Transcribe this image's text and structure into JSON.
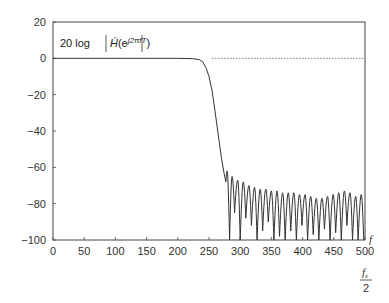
{
  "chart_data": {
    "type": "line",
    "title_parts": {
      "prefix": "20 log",
      "func": "Ĥ",
      "open": "(e",
      "exponent": "j2πfT",
      "close": ")"
    },
    "xlabel": "f",
    "xlabel_extra": {
      "numerator": "f",
      "numerator_sub": "s",
      "denominator": "2"
    },
    "ylabel": "",
    "xlim": [
      0,
      500
    ],
    "ylim": [
      -100,
      20
    ],
    "x_ticks": [
      0,
      50,
      100,
      150,
      200,
      250,
      300,
      350,
      400,
      450,
      500
    ],
    "x_tick_labels": [
      "0",
      "50",
      "100",
      "150",
      "200",
      "250",
      "300",
      "350",
      "400",
      "450",
      "500"
    ],
    "y_ticks": [
      20,
      0,
      -20,
      -40,
      -60,
      -80,
      -100
    ],
    "y_tick_labels": [
      "20",
      "0",
      "−20",
      "−40",
      "−60",
      "−80",
      "−100"
    ],
    "grid": false,
    "reference_line": {
      "y": 0,
      "style": "dotted",
      "x_start": 255,
      "x_end": 500
    },
    "series": [
      {
        "name": "magnitude response (dB)",
        "passband": {
          "x": [
            0,
            50,
            100,
            150,
            200,
            225,
            235,
            240,
            245,
            250,
            255,
            258,
            262,
            266,
            270,
            274,
            277
          ],
          "y": [
            0,
            0,
            0,
            0,
            0,
            -0.2,
            -0.8,
            -2,
            -5,
            -10,
            -18,
            -25,
            -35,
            -45,
            -55,
            -63,
            -68
          ]
        },
        "stopband_lobe_peaks_x": [
          279,
          287,
          296,
          305,
          314,
          323,
          332,
          341,
          350,
          359,
          368,
          377,
          386,
          395,
          404,
          413,
          422,
          431,
          440,
          449,
          458,
          467,
          476,
          485,
          494
        ],
        "stopband_lobe_peaks_y": [
          -62,
          -65,
          -67,
          -68,
          -70,
          -71,
          -72,
          -72,
          -73,
          -73,
          -74,
          -74,
          -74,
          -75,
          -75,
          -76,
          -77,
          -77,
          -76,
          -75,
          -74,
          -73,
          -74,
          -76,
          -75
        ],
        "stopband_null_x": [
          283,
          291,
          300,
          309,
          318,
          327,
          336,
          345,
          354,
          363,
          372,
          381,
          390,
          399,
          408,
          417,
          426,
          435,
          444,
          453,
          462,
          471,
          480,
          489,
          498
        ],
        "stopband_null_y": [
          -100,
          -85,
          -100,
          -88,
          -92,
          -100,
          -95,
          -90,
          -100,
          -98,
          -100,
          -95,
          -100,
          -92,
          -100,
          -97,
          -100,
          -94,
          -100,
          -96,
          -100,
          -92,
          -100,
          -100,
          -100
        ]
      }
    ]
  }
}
